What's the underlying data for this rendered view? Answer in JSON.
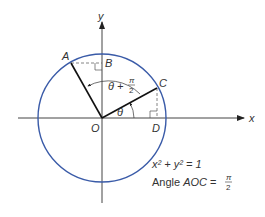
{
  "diagram": {
    "colors": {
      "circle": "#3a5ba8",
      "axes": "#444444",
      "segments": "#111111",
      "dashed": "#666666",
      "text": "#333333"
    },
    "axes": {
      "x_label": "x",
      "y_label": "y"
    },
    "points": {
      "A": "A",
      "B": "B",
      "C": "C",
      "D": "D",
      "O": "O"
    },
    "angles": {
      "theta": "θ",
      "theta_plus": "θ +",
      "pi": "π",
      "two": "2"
    },
    "equation": {
      "circle": "x² + y² = 1",
      "angle_prefix": "Angle ",
      "angle_name": "AOC",
      "equals": " =",
      "pi": "π",
      "two": "2"
    }
  }
}
